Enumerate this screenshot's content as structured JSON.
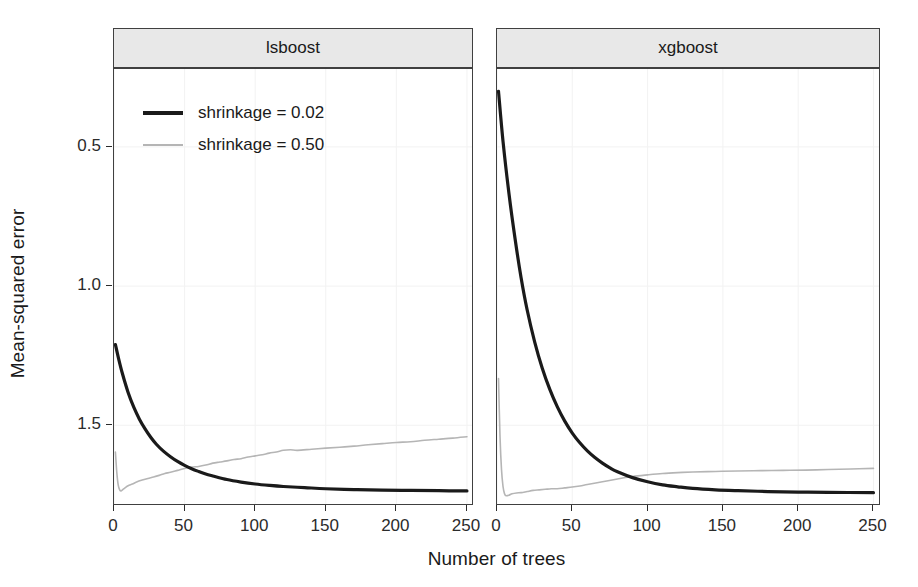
{
  "figure": {
    "width": 918,
    "height": 587,
    "background": "#ffffff"
  },
  "chart_data": {
    "type": "line",
    "title": "",
    "xlabel": "Number of trees",
    "ylabel": "Mean-squared error",
    "xlim": [
      0,
      255
    ],
    "ylim": [
      0.21,
      1.78
    ],
    "xticks": [
      0,
      50,
      100,
      150,
      200,
      250
    ],
    "yticks": [
      0.5,
      1.0,
      1.5
    ],
    "grid": "faint-white-panel-grid",
    "facets": [
      "lsboost",
      "xgboost"
    ],
    "legend": {
      "position": "inside-top-left-of-first-facet",
      "entries": [
        {
          "label": "shrinkage = 0.02",
          "color": "#1a1a1a",
          "width": 3.2
        },
        {
          "label": "shrinkage = 0.50",
          "color": "#b5b5b5",
          "width": 1.6
        }
      ]
    },
    "panels": [
      {
        "facet": "lsboost",
        "series": [
          {
            "name": "shrinkage = 0.02",
            "color": "#1a1a1a",
            "width": 3.2,
            "x": [
              1,
              3,
              6,
              10,
              14,
              18,
              22,
              26,
              30,
              35,
              40,
              45,
              50,
              55,
              60,
              65,
              70,
              80,
              90,
              100,
              110,
              120,
              135,
              150,
              170,
              190,
              210,
              230,
              250
            ],
            "y": [
              0.79,
              0.745,
              0.685,
              0.618,
              0.565,
              0.522,
              0.487,
              0.457,
              0.432,
              0.407,
              0.387,
              0.37,
              0.356,
              0.344,
              0.334,
              0.325,
              0.318,
              0.305,
              0.296,
              0.289,
              0.284,
              0.28,
              0.276,
              0.272,
              0.269,
              0.267,
              0.266,
              0.265,
              0.264
            ]
          },
          {
            "name": "shrinkage = 0.50",
            "color": "#b5b5b5",
            "width": 1.6,
            "x": [
              1,
              2,
              3,
              4,
              5,
              6,
              8,
              10,
              13,
              16,
              20,
              24,
              28,
              32,
              36,
              40,
              45,
              50,
              55,
              60,
              65,
              70,
              75,
              80,
              85,
              90,
              95,
              100,
              105,
              110,
              115,
              120,
              125,
              130,
              140,
              150,
              160,
              170,
              180,
              190,
              200,
              210,
              220,
              230,
              240,
              250
            ],
            "y": [
              0.404,
              0.33,
              0.285,
              0.268,
              0.264,
              0.268,
              0.276,
              0.283,
              0.289,
              0.296,
              0.303,
              0.309,
              0.314,
              0.32,
              0.327,
              0.331,
              0.338,
              0.345,
              0.35,
              0.352,
              0.357,
              0.364,
              0.368,
              0.372,
              0.377,
              0.38,
              0.386,
              0.39,
              0.394,
              0.4,
              0.404,
              0.41,
              0.412,
              0.41,
              0.414,
              0.418,
              0.421,
              0.425,
              0.43,
              0.434,
              0.438,
              0.441,
              0.446,
              0.45,
              0.454,
              0.459
            ]
          }
        ]
      },
      {
        "facet": "xgboost",
        "series": [
          {
            "name": "shrinkage = 0.02",
            "color": "#1a1a1a",
            "width": 3.2,
            "x": [
              1,
              4,
              8,
              12,
              16,
              20,
              25,
              30,
              35,
              40,
              45,
              50,
              55,
              60,
              65,
              70,
              75,
              80,
              90,
              100,
              110,
              120,
              130,
              145,
              160,
              180,
              200,
              220,
              250
            ],
            "y": [
              1.7,
              1.52,
              1.33,
              1.17,
              1.03,
              0.915,
              0.8,
              0.706,
              0.63,
              0.567,
              0.515,
              0.472,
              0.437,
              0.408,
              0.384,
              0.364,
              0.347,
              0.333,
              0.312,
              0.297,
              0.286,
              0.279,
              0.273,
              0.268,
              0.265,
              0.262,
              0.26,
              0.259,
              0.258
            ]
          },
          {
            "name": "shrinkage = 0.50",
            "color": "#b5b5b5",
            "width": 1.6,
            "x": [
              1,
              2,
              3,
              4,
              5,
              6,
              8,
              10,
              13,
              16,
              20,
              24,
              28,
              32,
              36,
              40,
              45,
              50,
              55,
              60,
              70,
              80,
              90,
              100,
              110,
              120,
              130,
              145,
              160,
              175,
              190,
              205,
              220,
              235,
              250
            ],
            "y": [
              0.668,
              0.46,
              0.34,
              0.28,
              0.254,
              0.247,
              0.249,
              0.254,
              0.257,
              0.258,
              0.262,
              0.266,
              0.268,
              0.27,
              0.272,
              0.272,
              0.275,
              0.278,
              0.282,
              0.287,
              0.297,
              0.307,
              0.316,
              0.322,
              0.327,
              0.33,
              0.332,
              0.334,
              0.336,
              0.337,
              0.338,
              0.339,
              0.341,
              0.343,
              0.345
            ]
          }
        ]
      }
    ]
  },
  "axes": {
    "ylabel": "Mean-squared error",
    "xlabel": "Number of trees",
    "ytick_labels": [
      "1.5",
      "1.0",
      "0.5"
    ],
    "xtick_labels": [
      "0",
      "50",
      "100",
      "150",
      "200",
      "250"
    ]
  },
  "panels": {
    "left": {
      "strip_label": "lsboost"
    },
    "right": {
      "strip_label": "xgboost"
    }
  },
  "legend": {
    "items": [
      {
        "label": "shrinkage = 0.02",
        "color": "#1a1a1a"
      },
      {
        "label": "shrinkage = 0.50",
        "color": "#b5b5b5"
      }
    ]
  },
  "colors": {
    "strip_fill": "#e8e8e8",
    "panel_border": "#404040",
    "series_dark": "#1a1a1a",
    "series_light": "#b5b5b5",
    "text": "#1a1a1a"
  }
}
